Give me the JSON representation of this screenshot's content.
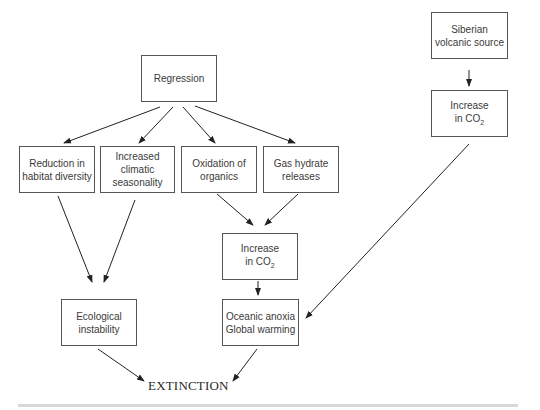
{
  "nodes": {
    "regression": {
      "lines": [
        "Regression"
      ]
    },
    "siberian": {
      "lines": [
        "Siberian",
        "volcanic source"
      ]
    },
    "co2_right": {
      "line1": "Increase",
      "line2": "in CO",
      "sub": "2"
    },
    "habitat": {
      "lines": [
        "Reduction in",
        "habitat diversity"
      ]
    },
    "seasonality": {
      "lines": [
        "Increased",
        "climatic",
        "seasonality"
      ]
    },
    "oxidation": {
      "lines": [
        "Oxidation of",
        "organics"
      ]
    },
    "gas_hydrate": {
      "lines": [
        "Gas hydrate",
        "releases"
      ]
    },
    "co2_center": {
      "line1": "Increase",
      "line2": "in CO",
      "sub": "2"
    },
    "ecological": {
      "lines": [
        "Ecological",
        "instability"
      ]
    },
    "anoxia": {
      "lines": [
        "Oceanic anoxia",
        "Global warming"
      ]
    }
  },
  "final": {
    "label": "EXTINCTION"
  },
  "colors": {
    "line": "#222222",
    "border": "#555555"
  }
}
